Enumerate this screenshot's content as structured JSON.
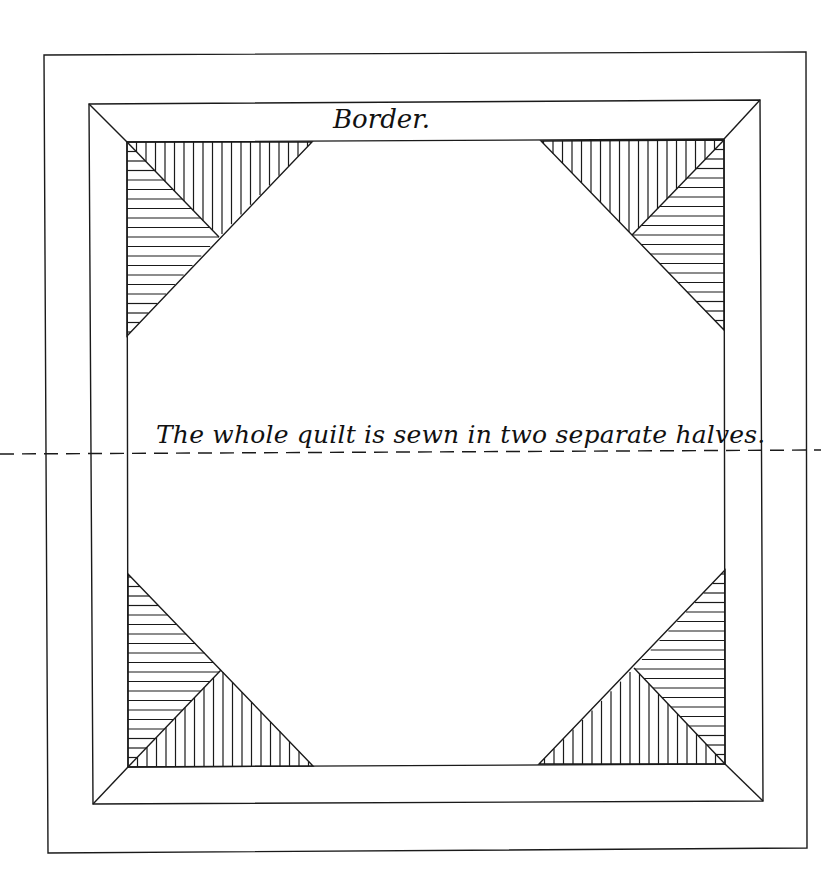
{
  "diagram": {
    "labels": {
      "border": "Border.",
      "note": "The whole quilt is sewn in two separate halves."
    },
    "colors": {
      "line": "#1a1a1a",
      "background": "#ffffff"
    },
    "frames": {
      "outer": [
        [
          44,
          55
        ],
        [
          806,
          52
        ],
        [
          807,
          848
        ],
        [
          48,
          853
        ]
      ],
      "border_outer": [
        [
          89,
          104
        ],
        [
          760,
          100
        ],
        [
          763,
          801
        ],
        [
          93,
          804
        ]
      ],
      "center_square": [
        [
          127,
          142
        ],
        [
          724,
          139
        ],
        [
          725,
          764
        ],
        [
          128,
          767
        ]
      ]
    },
    "miters": [
      [
        [
          89,
          104
        ],
        [
          127,
          142
        ]
      ],
      [
        [
          760,
          100
        ],
        [
          724,
          139
        ]
      ],
      [
        [
          763,
          801
        ],
        [
          725,
          764
        ]
      ],
      [
        [
          93,
          804
        ],
        [
          128,
          767
        ]
      ]
    ],
    "fold_line": {
      "y_left": 454,
      "y_right": 450,
      "x_start": 0,
      "x_end": 821,
      "style": "dashed"
    },
    "corner_triangles": [
      {
        "name": "top-left",
        "corner": [
          127,
          142
        ],
        "edge_a_end": [
          312,
          142
        ],
        "edge_b_end": [
          127,
          336
        ],
        "apex": [
          219,
          237
        ],
        "stripe_spacing": 9.5
      },
      {
        "name": "top-right",
        "corner": [
          724,
          140
        ],
        "edge_a_end": [
          541,
          141
        ],
        "edge_b_end": [
          724,
          330
        ],
        "apex": [
          632,
          235
        ],
        "stripe_spacing": 9.5
      },
      {
        "name": "bottom-left",
        "corner": [
          128,
          767
        ],
        "edge_a_end": [
          313,
          766
        ],
        "edge_b_end": [
          128,
          574
        ],
        "apex": [
          221,
          670
        ],
        "stripe_spacing": 9.5
      },
      {
        "name": "bottom-right",
        "corner": [
          725,
          764
        ],
        "edge_a_end": [
          539,
          764
        ],
        "edge_b_end": [
          725,
          570
        ],
        "apex": [
          634,
          668
        ],
        "stripe_spacing": 9.5
      }
    ]
  }
}
